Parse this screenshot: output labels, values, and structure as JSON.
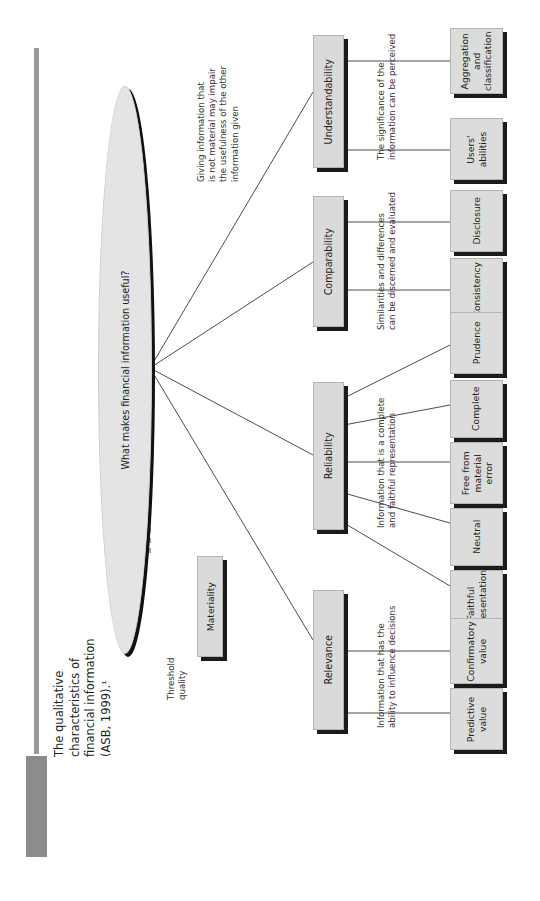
{
  "figure": {
    "badge": "FIGURE 34.1",
    "caption": "The qualitative\ncharacteristics of\nfinancial information\n(ASB, 1999).¹",
    "badge_color": "#8c8c8c",
    "rule_color": "#9b9b9b"
  },
  "diagram": {
    "type": "hierarchy-tree",
    "orientation": "rotated-90-ccw",
    "root": {
      "label": "What makes financial information useful?",
      "shape": "ellipse"
    },
    "threshold": {
      "note": "Threshold\nquality",
      "node": "Materiality",
      "annotation": "Giving information that\nis not material may impair\nthe usefulness of the other\ninformation given"
    },
    "branches": [
      {
        "name": "Understandability",
        "annotation": "The significance of the\ninformation can be perceived",
        "children": [
          "Aggregation\nand\nclassification",
          "Users'\nabilities"
        ]
      },
      {
        "name": "Comparability",
        "annotation": "Similarities and differences\ncan be discerned and evaluated",
        "children": [
          "Disclosure",
          "Consistency"
        ]
      },
      {
        "name": "Reliability",
        "annotation": "Information that is a complete\nand faithful representation",
        "children": [
          "Prudence",
          "Complete",
          "Free from\nmaterial\nerror",
          "Neutral",
          "Faithful\nrepresentation"
        ]
      },
      {
        "name": "Relevance",
        "annotation": "Information that has the\nability to influence decisions",
        "children": [
          "Confirmatory\nvalue",
          "Predictive\nvalue"
        ]
      }
    ],
    "colors": {
      "node_fill": "#dcdcdc",
      "node_shadow": "#1b1b1b",
      "ellipse_fill": "#e4e4e4",
      "connector": "#4d4d4d"
    }
  }
}
